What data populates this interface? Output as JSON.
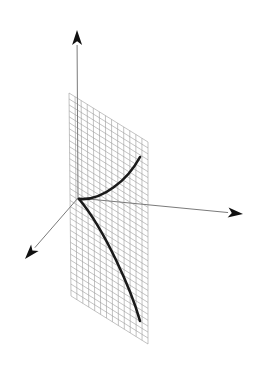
{
  "figure": {
    "colors": {
      "background": "#ffffff",
      "axes": "#7a7a7a",
      "arrowheads": "#111111",
      "grid": "#9a9a9a",
      "curve": "#1a1a1a"
    },
    "origin": [
      78,
      198
    ],
    "axes": [
      {
        "name": "vertical-axis",
        "tip": [
          77,
          30
        ]
      },
      {
        "name": "right-axis",
        "tip": [
          243,
          214
        ]
      },
      {
        "name": "front-left-axis",
        "tip": [
          25,
          259
        ]
      }
    ],
    "plane": {
      "corners": [
        [
          69,
          93
        ],
        [
          148,
          142
        ],
        [
          148,
          344
        ],
        [
          71,
          296
        ]
      ],
      "columns": 13,
      "rows": 34
    },
    "curve_branches": [
      {
        "name": "upper-branch",
        "from": [
          79,
          199
        ],
        "to": [
          140,
          157
        ]
      },
      {
        "name": "lower-branch",
        "from": [
          79,
          199
        ],
        "to": [
          140,
          321
        ]
      }
    ]
  }
}
